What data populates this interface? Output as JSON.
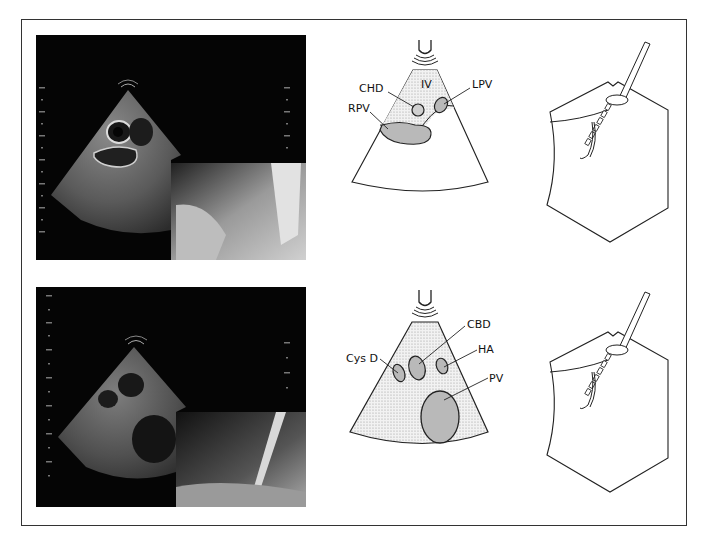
{
  "figure": {
    "panels": [
      {
        "row": "top",
        "ultrasound_photo": "endoscopic ultrasound image with inset endoscopic view",
        "schematic_labels": {
          "chd": "CHD",
          "iv": "IV",
          "lpv": "LPV",
          "rpv": "RPV"
        },
        "instrument_drawing": "echoendoscope needle puncture illustration"
      },
      {
        "row": "bottom",
        "ultrasound_photo": "endoscopic ultrasound image with inset endoscopic view",
        "schematic_labels": {
          "cbd": "CBD",
          "cysd": "Cys D",
          "ha": "HA",
          "pv": "PV"
        },
        "instrument_drawing": "echoendoscope needle puncture illustration"
      }
    ],
    "colors": {
      "frame": "#333333",
      "stipple": "#e6e6e6",
      "vessel_fill": "#b9b9b9",
      "line": "#222222"
    }
  }
}
